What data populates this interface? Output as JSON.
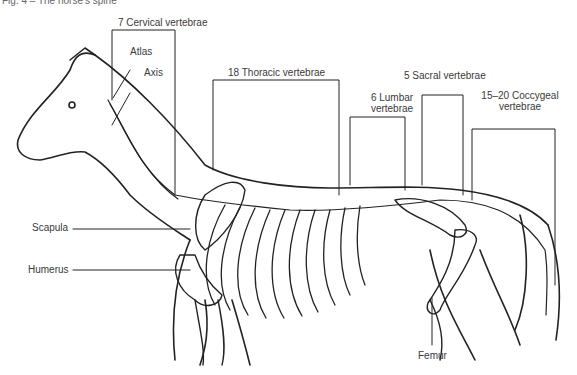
{
  "caption": "Fig. 4 – The horse’s spine",
  "labels": {
    "cervical": "7 Cervical vertebrae",
    "atlas": "Atlas",
    "axis": "Axis",
    "thoracic": "18 Thoracic vertebrae",
    "lumbar_line1": "6 Lumbar",
    "lumbar_line2": "vertebrae",
    "sacral": "5 Sacral vertebrae",
    "coccygeal_line1": "15–20 Coccygeal",
    "coccygeal_line2": "vertebrae",
    "scapula": "Scapula",
    "humerus": "Humerus",
    "femur": "Femur"
  },
  "colors": {
    "line": "#222222",
    "text": "#3a3a3a",
    "background": "#ffffff"
  }
}
